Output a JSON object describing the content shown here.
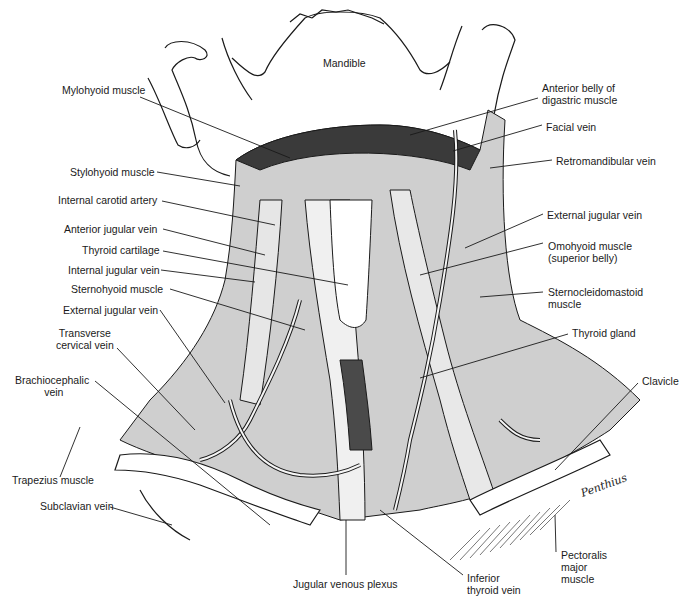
{
  "figure": {
    "colors": {
      "ink": "#1a1a1a",
      "paper": "#ffffff",
      "shade": "#2b2b2b"
    }
  },
  "labels": {
    "left": [
      {
        "id": "mylohyoid",
        "text": "Mylohyoid muscle",
        "x": 62,
        "y": 84
      },
      {
        "id": "stylohyoid",
        "text": "Stylohyoid muscle",
        "x": 70,
        "y": 166
      },
      {
        "id": "internal-carotid",
        "text": "Internal carotid artery",
        "x": 58,
        "y": 194
      },
      {
        "id": "anterior-jugular",
        "text": "Anterior jugular vein",
        "x": 64,
        "y": 223
      },
      {
        "id": "thyroid-cartilage",
        "text": "Thyroid cartilage",
        "x": 82,
        "y": 244
      },
      {
        "id": "internal-jugular",
        "text": "Internal jugular vein",
        "x": 68,
        "y": 264
      },
      {
        "id": "sternohyoid",
        "text": "Sternohyoid muscle",
        "x": 71,
        "y": 283
      },
      {
        "id": "external-jugular-left",
        "text": "External jugular vein",
        "x": 63,
        "y": 304
      },
      {
        "id": "transverse-cervical",
        "text": "Transverse\ncervical vein",
        "x": 56,
        "y": 327
      },
      {
        "id": "brachiocephalic",
        "text": "Brachiocephalic\n          vein",
        "x": 15,
        "y": 374
      },
      {
        "id": "trapezius",
        "text": "Trapezius muscle",
        "x": 12,
        "y": 474
      },
      {
        "id": "subclavian",
        "text": "Subclavian vein",
        "x": 40,
        "y": 500
      }
    ],
    "right": [
      {
        "id": "anterior-belly-digastric",
        "text": "Anterior belly of\ndigastric muscle",
        "x": 542,
        "y": 82
      },
      {
        "id": "facial-vein",
        "text": "Facial vein",
        "x": 546,
        "y": 121
      },
      {
        "id": "retromandibular",
        "text": "Retromandibular vein",
        "x": 556,
        "y": 155
      },
      {
        "id": "external-jugular-right",
        "text": "External jugular vein",
        "x": 547,
        "y": 209
      },
      {
        "id": "omohyoid",
        "text": "Omohyoid muscle\n(superior belly)",
        "x": 548,
        "y": 240
      },
      {
        "id": "sternocleidomastoid",
        "text": "Sternocleidomastoid\nmuscle",
        "x": 548,
        "y": 286
      },
      {
        "id": "thyroid-gland",
        "text": "Thyroid gland",
        "x": 572,
        "y": 327
      },
      {
        "id": "clavicle",
        "text": "Clavicle",
        "x": 642,
        "y": 375
      },
      {
        "id": "pectoralis",
        "text": "Pectoralis\nmajor\nmuscle",
        "x": 561,
        "y": 549
      },
      {
        "id": "inferior-thyroid",
        "text": "Inferior\nthyroid vein",
        "x": 467,
        "y": 572
      }
    ],
    "top": [
      {
        "id": "mandible",
        "text": "Mandible",
        "x": 323,
        "y": 57
      }
    ],
    "bottom": [
      {
        "id": "jugular-plexus",
        "text": "Jugular venous plexus",
        "x": 293,
        "y": 578
      }
    ]
  },
  "signature": "Penthius"
}
